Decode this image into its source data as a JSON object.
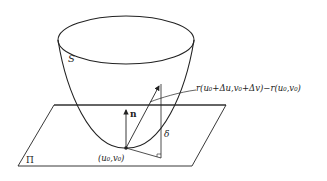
{
  "diagram": {
    "surface_label": "S",
    "plane_label": "Π",
    "normal_label": "n",
    "point_label": "(u₀,v₀)",
    "distance_label": "δ",
    "vector_label": "r(u₀+Δu,v₀+Δv)−r(u₀,v₀)",
    "colors": {
      "stroke": "#222222",
      "background": "#ffffff"
    }
  }
}
